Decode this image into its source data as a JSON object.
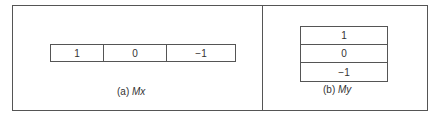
{
  "panels": [
    {
      "caption_prefix": "(a) ",
      "caption_var": "Mx",
      "cells": [
        "1",
        "0",
        "−1"
      ]
    },
    {
      "caption_prefix": "(b) ",
      "caption_var": "My",
      "cells": [
        "1",
        "0",
        "−1"
      ]
    }
  ]
}
